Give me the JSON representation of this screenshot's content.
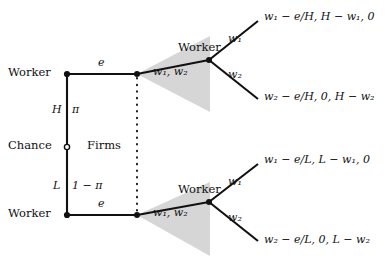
{
  "diagram": {
    "type": "extensive-form-game-tree",
    "title_visible": false,
    "background_color": "#ffffff",
    "line_color": "#111111",
    "information_set_fill": "#cccccc",
    "nodes": {
      "worker_high": {
        "label": "Worker",
        "kind": "decision",
        "marker": "filled-dot"
      },
      "chance": {
        "label": "Chance",
        "kind": "chance",
        "marker": "open-circle"
      },
      "worker_low": {
        "label": "Worker",
        "kind": "decision",
        "marker": "filled-dot"
      },
      "firms": {
        "label": "Firms",
        "kind": "information-set"
      },
      "worker_high_wage": {
        "label": "Worker",
        "kind": "decision",
        "marker": "filled-dot"
      },
      "worker_low_wage": {
        "label": "Worker",
        "kind": "decision",
        "marker": "filled-dot"
      }
    },
    "branches": {
      "chance_high_type": "H",
      "chance_high_prob": "π",
      "chance_low_type": "L",
      "chance_low_prob": "1 − π",
      "effort_top": "e",
      "effort_bottom": "e",
      "firm_offers_top": "w₁, w₂",
      "firm_offers_bottom": "w₁, w₂",
      "accept_w1_top": "w₁",
      "accept_w2_top": "w₂",
      "accept_w1_bottom": "w₁",
      "accept_w2_bottom": "w₂"
    },
    "payoffs": {
      "top_upper": "w₁ − e/H, H − w₁, 0",
      "top_lower": "w₂ − e/H, 0, H − w₂",
      "bottom_upper": "w₁ − e/L, L − w₁, 0",
      "bottom_lower": "w₂ − e/L, 0, L − w₂"
    }
  }
}
